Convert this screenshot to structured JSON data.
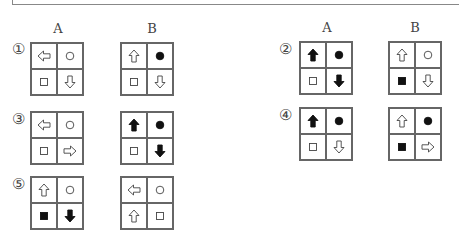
{
  "headers": {
    "left": {
      "a": "A",
      "b": "B"
    },
    "right": {
      "a": "A",
      "b": "B"
    }
  },
  "problems": [
    {
      "label": "①",
      "A": [
        "arrow-left-outline",
        "circle-outline",
        "square-outline",
        "arrow-down-outline"
      ],
      "B": [
        "arrow-up-outline",
        "circle-filled",
        "square-outline",
        "arrow-down-outline"
      ]
    },
    {
      "label": "②",
      "A": [
        "arrow-up-filled",
        "circle-filled",
        "square-outline",
        "arrow-down-filled"
      ],
      "B": [
        "arrow-up-outline",
        "circle-outline",
        "square-filled",
        "arrow-down-outline"
      ]
    },
    {
      "label": "③",
      "A": [
        "arrow-left-outline",
        "circle-outline",
        "square-outline",
        "arrow-right-outline"
      ],
      "B": [
        "arrow-up-filled",
        "circle-filled",
        "square-outline",
        "arrow-down-filled"
      ]
    },
    {
      "label": "④",
      "A": [
        "arrow-up-filled",
        "circle-filled",
        "square-outline",
        "arrow-down-outline"
      ],
      "B": [
        "arrow-up-outline",
        "circle-filled",
        "square-filled",
        "arrow-right-outline"
      ]
    },
    {
      "label": "⑤",
      "A": [
        "arrow-up-outline",
        "circle-outline",
        "square-filled",
        "arrow-down-filled"
      ],
      "B": [
        "arrow-left-outline",
        "circle-outline",
        "arrow-up-outline",
        "square-outline"
      ]
    }
  ]
}
